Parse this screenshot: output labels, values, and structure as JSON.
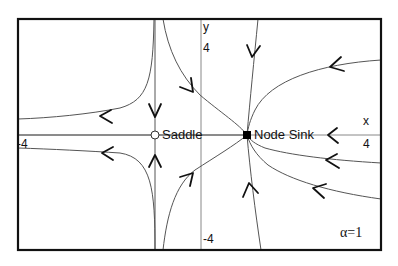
{
  "diagram": {
    "type": "phase-portrait",
    "parameter_label": "α=1",
    "axes": {
      "x_label": "x",
      "y_label": "y",
      "x_ticks": {
        "min": "-4",
        "max": "4"
      },
      "y_ticks": {
        "min": "-4",
        "max": "4"
      }
    },
    "equilibria": [
      {
        "name": "Saddle",
        "type": "saddle",
        "marker": "open-circle"
      },
      {
        "name": "Node Sink",
        "type": "stable-node",
        "marker": "filled-square"
      }
    ],
    "colors": {
      "frame": "#111111",
      "axes": "#888888",
      "trajectories": "#555555",
      "arrows": "#111111",
      "background": "#ffffff"
    }
  }
}
